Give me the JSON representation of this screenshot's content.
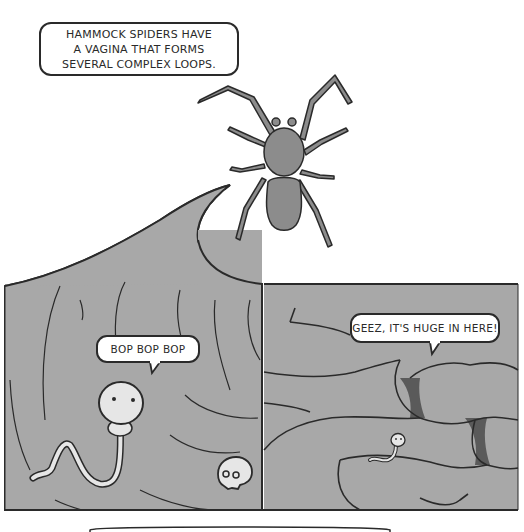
{
  "comic": {
    "caption": {
      "lines": [
        "HAMMOCK SPIDERS HAVE",
        "A VAGINA THAT FORMS",
        "SEVERAL COMPLEX LOOPS."
      ]
    },
    "panels": [
      {
        "name": "left-panel",
        "speech": "BOP BOP BOP",
        "characters": [
          "sperm-character",
          "skull"
        ]
      },
      {
        "name": "right-panel",
        "speech": "GEEZ, IT'S HUGE IN HERE!",
        "characters": [
          "small-sperm-character"
        ]
      }
    ],
    "colors": {
      "background": "#ffffff",
      "panel_fill": "#a8a8a8",
      "spider_fill": "#8c8c8c",
      "outline": "#2a2a2a",
      "dark_gap": "#5a5a5a",
      "character_fill": "#e6e6e6"
    }
  }
}
